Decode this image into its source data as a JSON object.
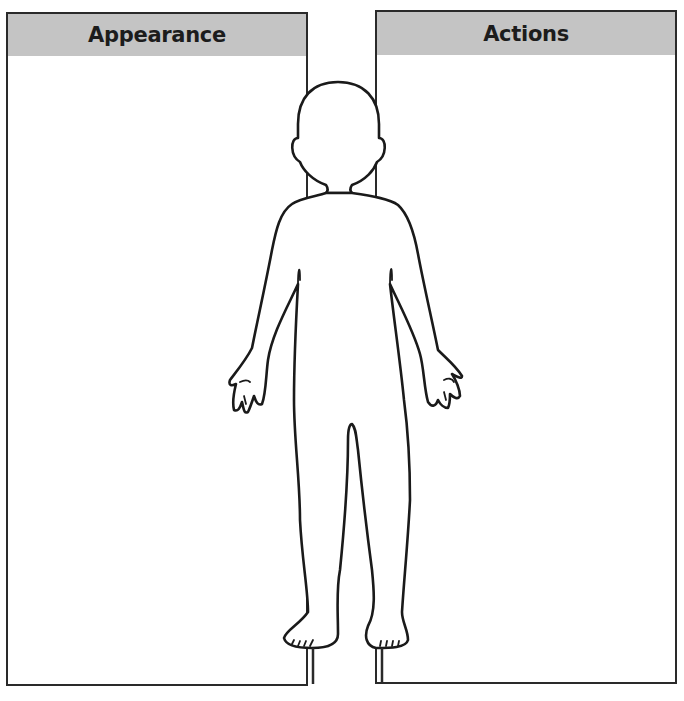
{
  "worksheet": {
    "panels": [
      {
        "title": "Appearance",
        "content": ""
      },
      {
        "title": "Actions",
        "content": ""
      }
    ],
    "figure": {
      "icon": "child-body-outline-icon"
    },
    "colors": {
      "header_fill": "#c4c4c4",
      "border": "#2a2a2a",
      "outline": "#1a1a1a",
      "background": "#ffffff"
    }
  }
}
